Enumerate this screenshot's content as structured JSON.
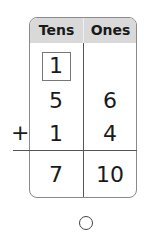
{
  "table": {
    "headers": [
      "Tens",
      "Ones"
    ],
    "carry": {
      "tens": "1"
    },
    "addend1": {
      "tens": "5",
      "ones": "6"
    },
    "addend2": {
      "tens": "1",
      "ones": "4"
    },
    "sum": {
      "tens": "7",
      "ones": "10"
    },
    "operator": "+"
  },
  "colors": {
    "header_bg": "#d9d9d9",
    "border": "#8a8a8a"
  },
  "answer_choice": {
    "icon": "radio-circle-icon"
  }
}
